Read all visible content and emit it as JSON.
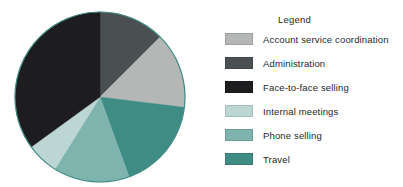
{
  "legend": {
    "title": "Legend",
    "position": "right"
  },
  "chart_data": {
    "type": "pie",
    "title": "",
    "subtitle": "",
    "xlabel": "",
    "ylabel": "",
    "grid": false,
    "legend_position": "right",
    "start_angle_deg": 0,
    "direction": "clockwise",
    "center": {
      "x": 86,
      "y": 86
    },
    "radius": 85,
    "categories": [
      "Account service coordination",
      "Administration",
      "Face-to-face selling",
      "Internal meetings",
      "Phone selling",
      "Travel"
    ],
    "slices": [
      {
        "label": "Administration",
        "value": 12.5,
        "color": "#4a4f52",
        "start_deg": 0,
        "end_deg": 45
      },
      {
        "label": "Account service coordination",
        "value": 14.5,
        "color": "#b4b7b6",
        "start_deg": 45,
        "end_deg": 97
      },
      {
        "label": "Travel",
        "value": 17.5,
        "color": "#3f8c85",
        "start_deg": 97,
        "end_deg": 160
      },
      {
        "label": "Phone selling",
        "value": 14.5,
        "color": "#7fb3ae",
        "start_deg": 160,
        "end_deg": 212
      },
      {
        "label": "Internal meetings",
        "value": 6.0,
        "color": "#bcd6d3",
        "start_deg": 212,
        "end_deg": 234
      },
      {
        "label": "Face-to-face selling",
        "value": 35.0,
        "color": "#1d1d1f",
        "start_deg": 234,
        "end_deg": 360
      }
    ],
    "values": [
      14.5,
      12.5,
      35.0,
      6.0,
      14.5,
      17.5
    ],
    "colors": [
      "#b4b7b6",
      "#4a4f52",
      "#1d1d1f",
      "#bcd6d3",
      "#7fb3ae",
      "#3f8c85"
    ],
    "outline_color": "#3f8c85"
  },
  "legend_items": [
    {
      "label": "Account service coordination",
      "color": "#b4b7b6"
    },
    {
      "label": "Administration",
      "color": "#4a4f52"
    },
    {
      "label": "Face-to-face selling",
      "color": "#1d1d1f"
    },
    {
      "label": "Internal meetings",
      "color": "#bcd6d3"
    },
    {
      "label": "Phone selling",
      "color": "#7fb3ae"
    },
    {
      "label": "Travel",
      "color": "#3f8c85"
    }
  ]
}
